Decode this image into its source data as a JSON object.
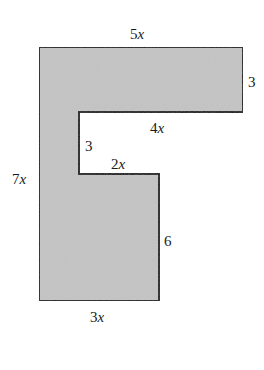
{
  "figure": {
    "type": "F-shaped composite polygon",
    "fill_color": "#c4c4c4",
    "stroke_color": "#1a1a1a",
    "labels": {
      "top": {
        "num": "5",
        "var": "x"
      },
      "right_top": {
        "num": "3",
        "var": ""
      },
      "inner_top": {
        "num": "4",
        "var": "x"
      },
      "inner_left": {
        "num": "3",
        "var": ""
      },
      "inner_step": {
        "num": "2",
        "var": "x"
      },
      "left": {
        "num": "7",
        "var": "x"
      },
      "right_bottom": {
        "num": "6",
        "var": ""
      },
      "bottom": {
        "num": "3",
        "var": "x"
      }
    }
  }
}
